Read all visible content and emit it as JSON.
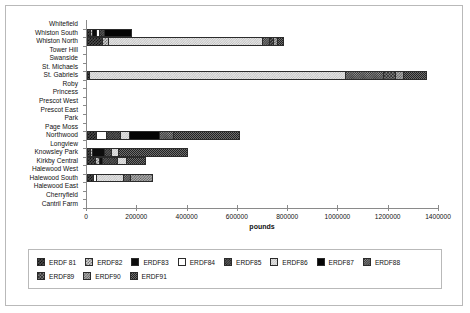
{
  "chart_data": {
    "type": "bar",
    "orientation": "horizontal",
    "stacked": true,
    "title": "",
    "xlabel": "pounds",
    "ylabel": "",
    "xlim": [
      0,
      1400000
    ],
    "xticks": [
      0,
      200000,
      400000,
      600000,
      800000,
      1000000,
      1200000,
      1400000
    ],
    "xtick_labels": [
      "0",
      "200000",
      "400000",
      "600000",
      "800000",
      "1000000",
      "1200000",
      "1400000"
    ],
    "grid": false,
    "legend_position": "bottom",
    "categories": [
      "Whitefield",
      "Whiston South",
      "Whiston North",
      "Tower Hill",
      "Swanside",
      "St. Michaels",
      "St. Gabriels",
      "Roby",
      "Princess",
      "Prescot West",
      "Prescot East",
      "Park",
      "Page Moss",
      "Northwood",
      "Longview",
      "Knowsley Park",
      "Kirkby Central",
      "Halewood West",
      "Halewood South",
      "Halewood East",
      "Cherryfield",
      "Cantril Farm"
    ],
    "series": [
      {
        "name": "ERDF 81",
        "pattern": "p1",
        "values": [
          0,
          12000,
          60000,
          0,
          0,
          0,
          8000,
          0,
          0,
          0,
          0,
          0,
          0,
          36000,
          0,
          10000,
          30000,
          0,
          22000,
          0,
          0,
          0
        ]
      },
      {
        "name": "ERDF82",
        "pattern": "p2",
        "values": [
          0,
          9000,
          25000,
          0,
          0,
          0,
          0,
          0,
          0,
          0,
          0,
          0,
          0,
          0,
          0,
          8000,
          18000,
          0,
          0,
          0,
          0,
          0
        ]
      },
      {
        "name": "ERDF83",
        "pattern": "p3",
        "values": [
          0,
          16000,
          0,
          0,
          0,
          0,
          0,
          0,
          0,
          0,
          0,
          0,
          0,
          0,
          0,
          48000,
          10000,
          0,
          0,
          0,
          0,
          0
        ]
      },
      {
        "name": "ERDF84",
        "pattern": "p4",
        "values": [
          0,
          9000,
          0,
          0,
          0,
          0,
          0,
          0,
          0,
          0,
          0,
          0,
          0,
          40000,
          0,
          0,
          0,
          0,
          13000,
          0,
          0,
          0
        ]
      },
      {
        "name": "ERDF85",
        "pattern": "p5",
        "values": [
          0,
          22000,
          0,
          0,
          0,
          0,
          0,
          0,
          0,
          0,
          0,
          0,
          0,
          55000,
          0,
          30000,
          62000,
          0,
          0,
          0,
          0,
          0
        ]
      },
      {
        "name": "ERDF86",
        "pattern": "p6",
        "values": [
          0,
          0,
          610000,
          0,
          0,
          0,
          1020000,
          0,
          0,
          0,
          0,
          0,
          0,
          36000,
          0,
          28000,
          35000,
          0,
          110000,
          0,
          0,
          0
        ]
      },
      {
        "name": "ERDF87",
        "pattern": "p7",
        "values": [
          0,
          112000,
          0,
          0,
          0,
          0,
          0,
          0,
          0,
          0,
          0,
          0,
          0,
          118000,
          0,
          0,
          0,
          0,
          0,
          0,
          0,
          0
        ]
      },
      {
        "name": "ERDF88",
        "pattern": "p8",
        "values": [
          0,
          0,
          28000,
          0,
          0,
          0,
          150000,
          0,
          0,
          0,
          0,
          0,
          0,
          58000,
          0,
          0,
          0,
          0,
          26000,
          0,
          0,
          0
        ]
      },
      {
        "name": "ERDF89",
        "pattern": "p9",
        "values": [
          0,
          0,
          16000,
          0,
          0,
          0,
          48000,
          0,
          0,
          0,
          0,
          0,
          0,
          0,
          0,
          0,
          0,
          0,
          0,
          0,
          0,
          0
        ]
      },
      {
        "name": "ERDF90",
        "pattern": "p10",
        "values": [
          0,
          0,
          18000,
          0,
          0,
          0,
          30000,
          0,
          0,
          0,
          0,
          0,
          0,
          0,
          0,
          0,
          0,
          0,
          92000,
          0,
          0,
          0
        ]
      },
      {
        "name": "ERDF91",
        "pattern": "p11",
        "values": [
          0,
          0,
          28000,
          0,
          0,
          0,
          96000,
          0,
          0,
          0,
          0,
          0,
          0,
          266000,
          0,
          278000,
          80000,
          0,
          0,
          0,
          0,
          0
        ]
      }
    ],
    "totals": [
      0,
      180000,
      785000,
      0,
      0,
      0,
      1352000,
      0,
      0,
      0,
      0,
      0,
      0,
      609000,
      0,
      402000,
      235000,
      0,
      263000,
      0,
      0,
      0
    ]
  },
  "legend": {
    "rows": [
      [
        "ERDF 81",
        "ERDF82",
        "ERDF83",
        "ERDF84",
        "ERDF85",
        "ERDF86",
        "ERDF87",
        "ERDF88"
      ],
      [
        "ERDF89",
        "ERDF90",
        "ERDF91"
      ]
    ]
  }
}
